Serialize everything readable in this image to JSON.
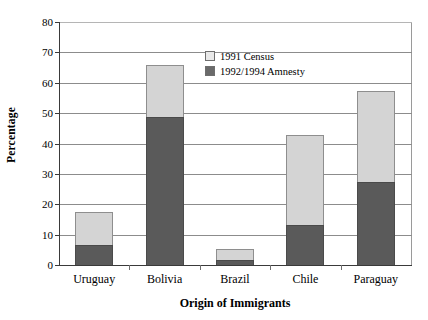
{
  "chart_data": {
    "type": "bar",
    "subtype": "stacked-vertical",
    "title": "",
    "xlabel": "Origin of Immigrants",
    "ylabel": "Percentage",
    "categories": [
      "Uruguay",
      "Bolivia",
      "Brazil",
      "Chile",
      "Paraguay"
    ],
    "series": [
      {
        "name": "1992/1994 Amnesty",
        "color": "#5a5a5a",
        "values": [
          7,
          49,
          2,
          13.5,
          27.5
        ]
      },
      {
        "name": "1991 Census",
        "color": "#d4d4d4",
        "values": [
          11,
          17.5,
          4,
          30,
          30.5
        ]
      }
    ],
    "totals": [
      18,
      66.5,
      6,
      43.5,
      58
    ],
    "ylim": [
      0,
      80
    ],
    "ytick_step": 10,
    "yticks": [
      0,
      10,
      20,
      30,
      40,
      50,
      60,
      70,
      80
    ],
    "ytick_labels": [
      "0",
      "10",
      "20",
      "30",
      "40",
      "50",
      "60",
      "70",
      "80"
    ],
    "grid": "horizontal",
    "legend_position": "top-right-inside",
    "stack_order_bottom_to_top": [
      "1992/1994 Amnesty",
      "1991 Census"
    ]
  },
  "axes": {
    "y_title": "Percentage",
    "x_title": "Origin of Immigrants"
  },
  "legend": {
    "entries": [
      {
        "label": "1991 Census",
        "swatch": "light-gray-square"
      },
      {
        "label": "1992/1994 Amnesty",
        "swatch": "dark-gray-square"
      }
    ]
  },
  "colors": {
    "series_light": "#d4d4d4",
    "series_dark": "#5a5a5a",
    "gridline": "#8c8c8c",
    "axis": "#3a3a3a",
    "background": "#ffffff",
    "text": "#000000"
  }
}
